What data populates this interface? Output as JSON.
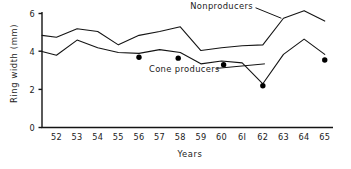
{
  "chart_data": {
    "type": "line",
    "title": "",
    "xlabel": "Years",
    "ylabel": "Ring width (mm)",
    "x": [
      52,
      53,
      54,
      55,
      56,
      57,
      58,
      59,
      60,
      61,
      62,
      63,
      64,
      65
    ],
    "xtick_labels": [
      "52",
      "53",
      "54",
      "55",
      "56",
      "57",
      "58",
      "59",
      "60",
      "6I",
      "62",
      "63",
      "64",
      "65"
    ],
    "ytick_labels": [
      "0",
      "2",
      "4",
      "6"
    ],
    "ytick_values": [
      0,
      2,
      4,
      6
    ],
    "xlim": [
      51.3,
      65.4
    ],
    "ylim": [
      0,
      6.4
    ],
    "grid": false,
    "legend_position": "inline-annotations",
    "series": [
      {
        "name": "Nonproducers",
        "label_text": "Nonproducers",
        "color": "#141414",
        "x": [
          51.3,
          52,
          53,
          54,
          55,
          56,
          57,
          58,
          59,
          60,
          61,
          62,
          63,
          64,
          65
        ],
        "values": [
          4.85,
          4.75,
          5.2,
          5.05,
          4.35,
          4.85,
          5.05,
          5.3,
          4.05,
          4.2,
          4.3,
          4.35,
          5.75,
          6.15,
          5.6
        ]
      },
      {
        "name": "Cone producers",
        "label_text": "Cone producers",
        "color": "#141414",
        "x": [
          51.3,
          52,
          53,
          54,
          55,
          56,
          57,
          58,
          59,
          60,
          61,
          62,
          63,
          64,
          65
        ],
        "values": [
          4.0,
          3.8,
          4.6,
          4.2,
          3.95,
          3.9,
          4.1,
          3.95,
          3.35,
          3.5,
          3.4,
          2.3,
          3.85,
          4.65,
          3.85
        ]
      }
    ],
    "markers": {
      "name": "Cone producer sample points",
      "shape": "filled-circle",
      "color": "#000000",
      "points": [
        {
          "x": 56.0,
          "y": 3.7
        },
        {
          "x": 57.9,
          "y": 3.65
        },
        {
          "x": 60.1,
          "y": 3.3
        },
        {
          "x": 62.0,
          "y": 2.2
        },
        {
          "x": 65.0,
          "y": 3.55
        }
      ]
    },
    "annotations": [
      {
        "text": "Nonproducers",
        "x": 60.0,
        "y": 6.25,
        "leader_to": {
          "x": 62.9,
          "y": 5.75
        }
      },
      {
        "text": "Cone producers",
        "x": 58.2,
        "y": 2.9,
        "leader_to": {
          "x": 62.1,
          "y": 3.35
        }
      }
    ]
  }
}
